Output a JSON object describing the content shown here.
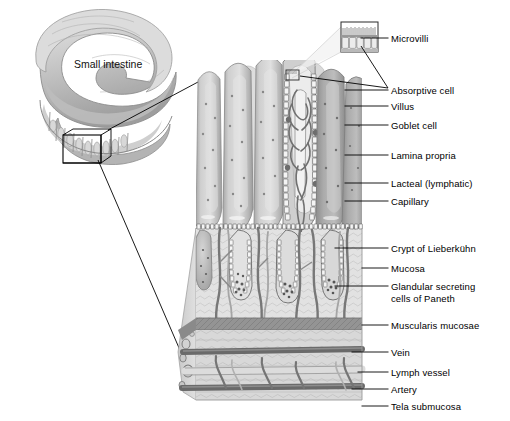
{
  "figure": {
    "organ_label": "Small intestine",
    "caption": "",
    "colors": {
      "outline": "#1a1a1a",
      "leader_line": "#000000",
      "tissue_light": "#e3e3e3",
      "tissue_mid": "#bdbdbd",
      "tissue_dark": "#8f8f8f",
      "vessel_dark": "#6e6e6e",
      "background": "#ffffff"
    }
  },
  "labels": [
    {
      "id": "microvilli",
      "text": "Microvilli",
      "x": 391,
      "y": 33,
      "line": {
        "x1": 361,
        "y1": 38,
        "x2": 388,
        "y2": 38
      }
    },
    {
      "id": "absorptive-cell",
      "text": "Absorptive cell",
      "x": 391,
      "y": 85,
      "line": {
        "x1": 345,
        "y1": 90,
        "x2": 388,
        "y2": 90
      }
    },
    {
      "id": "villus",
      "text": "Villus",
      "x": 391,
      "y": 101,
      "line": {
        "x1": 345,
        "y1": 106,
        "x2": 388,
        "y2": 106
      }
    },
    {
      "id": "goblet-cell",
      "text": "Goblet cell",
      "x": 391,
      "y": 120,
      "line": {
        "x1": 345,
        "y1": 125,
        "x2": 388,
        "y2": 125
      }
    },
    {
      "id": "lamina-propria",
      "text": "Lamina propria",
      "x": 391,
      "y": 150,
      "line": {
        "x1": 345,
        "y1": 155,
        "x2": 388,
        "y2": 155
      }
    },
    {
      "id": "lacteal-lymphatic",
      "text": "Lacteal (lymphatic)",
      "x": 391,
      "y": 178,
      "line": {
        "x1": 345,
        "y1": 183,
        "x2": 388,
        "y2": 183
      }
    },
    {
      "id": "capillary",
      "text": "Capillary",
      "x": 391,
      "y": 196,
      "line": {
        "x1": 345,
        "y1": 201,
        "x2": 388,
        "y2": 201
      }
    },
    {
      "id": "crypt-of-lieberkuhn",
      "text": "Crypt of Lieberkühn",
      "x": 391,
      "y": 243,
      "line": {
        "x1": 335,
        "y1": 248,
        "x2": 388,
        "y2": 248
      }
    },
    {
      "id": "mucosa",
      "text": "Mucosa",
      "x": 391,
      "y": 263,
      "line": {
        "x1": 362,
        "y1": 268,
        "x2": 388,
        "y2": 268
      }
    },
    {
      "id": "paneth-cells",
      "text": "Glandular secreting\ncells of Paneth",
      "x": 391,
      "y": 281,
      "line": {
        "x1": 335,
        "y1": 286,
        "x2": 388,
        "y2": 286
      }
    },
    {
      "id": "muscularis-mucosae",
      "text": "Muscularis mucosae",
      "x": 391,
      "y": 320,
      "line": {
        "x1": 362,
        "y1": 325,
        "x2": 388,
        "y2": 325
      }
    },
    {
      "id": "vein",
      "text": "Vein",
      "x": 391,
      "y": 347,
      "line": {
        "x1": 352,
        "y1": 352,
        "x2": 388,
        "y2": 352
      }
    },
    {
      "id": "lymph-vessel",
      "text": "Lymph vessel",
      "x": 391,
      "y": 367,
      "line": {
        "x1": 358,
        "y1": 372,
        "x2": 388,
        "y2": 372
      }
    },
    {
      "id": "artery",
      "text": "Artery",
      "x": 391,
      "y": 384,
      "line": {
        "x1": 352,
        "y1": 389,
        "x2": 388,
        "y2": 389
      }
    },
    {
      "id": "tela-submucosa",
      "text": "Tela submucosa",
      "x": 391,
      "y": 401,
      "line": {
        "x1": 362,
        "y1": 406,
        "x2": 388,
        "y2": 406
      }
    }
  ],
  "organ_label_pos": {
    "x": 74,
    "y": 58
  },
  "callout_box": {
    "x": 63,
    "y": 135,
    "width": 38,
    "height": 28
  },
  "inset_box": {
    "x": 341,
    "y": 22,
    "width": 37,
    "height": 30
  }
}
